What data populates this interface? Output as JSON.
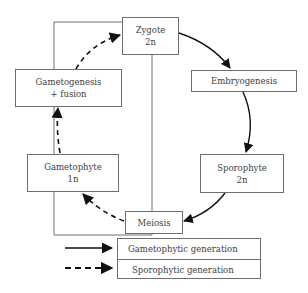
{
  "diagram": {
    "nodes": {
      "zygote": {
        "line1": "Zygote",
        "line2": "2n"
      },
      "embryogenesis": {
        "line1": "Embryogenesis"
      },
      "sporophyte": {
        "line1": "Sporophyte",
        "line2": "2n"
      },
      "meiosis": {
        "line1": "Meiosis"
      },
      "gametophyte": {
        "line1": "Gametophyte",
        "line2": "1n"
      },
      "gametogenesis": {
        "line1": "Gametogenesis",
        "line2": "+ fusion"
      }
    },
    "edges": [
      {
        "from": "zygote",
        "to": "embryogenesis",
        "style": "solid"
      },
      {
        "from": "embryogenesis",
        "to": "sporophyte",
        "style": "solid"
      },
      {
        "from": "sporophyte",
        "to": "meiosis",
        "style": "solid"
      },
      {
        "from": "meiosis",
        "to": "gametophyte",
        "style": "dashed"
      },
      {
        "from": "gametophyte",
        "to": "gametogenesis",
        "style": "dashed"
      },
      {
        "from": "gametogenesis",
        "to": "zygote",
        "style": "dashed"
      }
    ],
    "legend": {
      "solid": "Gametophytic generation",
      "dashed": "Sporophytic generation"
    },
    "colors": {
      "stroke": "#6e6e6e",
      "arrow": "#111111",
      "text": "#3d3d3d"
    }
  }
}
